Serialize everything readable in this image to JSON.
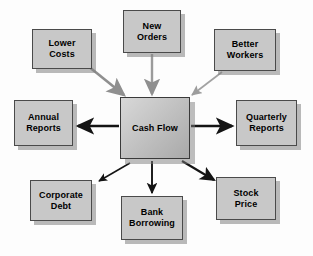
{
  "diagram": {
    "background_color": "#fdfdfd",
    "node_fill_color": "#c8c8c8",
    "node_border_color": "#4a4a4a",
    "shadow_color": "#828282",
    "inflow_arrow_color": "#8f8f8f",
    "outflow_arrow_color": "#1a1a1a",
    "center": {
      "label": "Cash Flow",
      "x": 120,
      "y": 97,
      "width": 70,
      "height": 62,
      "gradient_from": "#d8d8d8",
      "gradient_to": "#a9a9a9"
    },
    "inputs": [
      {
        "id": "lower-costs",
        "label": "Lower\nCosts",
        "x": 32,
        "y": 29,
        "width": 60,
        "height": 40
      },
      {
        "id": "new-orders",
        "label": "New\nOrders",
        "x": 123,
        "y": 10,
        "width": 58,
        "height": 43
      },
      {
        "id": "better-workers",
        "label": "Better\nWorkers",
        "x": 214,
        "y": 29,
        "width": 62,
        "height": 42
      }
    ],
    "outputs": [
      {
        "id": "annual-reports",
        "label": "Annual\nReports",
        "x": 14,
        "y": 100,
        "width": 59,
        "height": 46
      },
      {
        "id": "quarterly-reports",
        "label": "Quarterly\nReports",
        "x": 236,
        "y": 100,
        "width": 61,
        "height": 46
      },
      {
        "id": "corporate-debt",
        "label": "Corporate\nDebt",
        "x": 30,
        "y": 180,
        "width": 62,
        "height": 41
      },
      {
        "id": "bank-borrowing",
        "label": "Bank\nBorrowing",
        "x": 121,
        "y": 196,
        "width": 62,
        "height": 44
      },
      {
        "id": "stock-price",
        "label": "Stock\nPrice",
        "x": 216,
        "y": 177,
        "width": 60,
        "height": 43
      }
    ],
    "connections": [
      {
        "id": "lower-costs-to-cash-flow",
        "from": "lower-costs",
        "to": "cash-flow",
        "direction": "into-center",
        "style": "gray-thick-diagonal"
      },
      {
        "id": "new-orders-to-cash-flow",
        "from": "new-orders",
        "to": "cash-flow",
        "direction": "into-center",
        "style": "gray-vertical"
      },
      {
        "id": "better-workers-to-cash-flow",
        "from": "better-workers",
        "to": "cash-flow",
        "direction": "into-center",
        "style": "gray-thin-diagonal"
      },
      {
        "id": "cash-flow-to-annual-reports",
        "from": "cash-flow",
        "to": "annual-reports",
        "direction": "out-of-center",
        "style": "black-thick-horizontal"
      },
      {
        "id": "cash-flow-to-quarterly-reports",
        "from": "cash-flow",
        "to": "quarterly-reports",
        "direction": "out-of-center",
        "style": "black-thick-horizontal"
      },
      {
        "id": "cash-flow-to-corporate-debt",
        "from": "cash-flow",
        "to": "corporate-debt",
        "direction": "out-of-center",
        "style": "black-thin-diagonal"
      },
      {
        "id": "cash-flow-to-bank-borrowing",
        "from": "cash-flow",
        "to": "bank-borrowing",
        "direction": "out-of-center",
        "style": "black-vertical"
      },
      {
        "id": "cash-flow-to-stock-price",
        "from": "cash-flow",
        "to": "stock-price",
        "direction": "out-of-center",
        "style": "black-thick-diagonal"
      }
    ]
  }
}
